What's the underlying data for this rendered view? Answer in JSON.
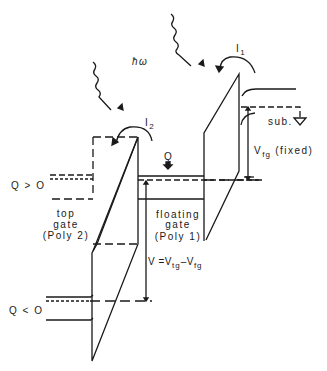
{
  "figure": {
    "photon_label": "ħω",
    "current_1": {
      "symbol": "I",
      "sub": "1"
    },
    "current_2": {
      "symbol": "I",
      "sub": "2"
    },
    "charge_label": "Q",
    "substrate_label": "sub.",
    "vfg": {
      "symbol": "V",
      "sub": "fg",
      "suffix": "(fixed)"
    },
    "q_pos_label": "Q > O",
    "q_neg_label": "Q < O",
    "top_gate": {
      "line1": "top",
      "line2": "gate",
      "line3": "(Poly 2)"
    },
    "floating_gate": {
      "line1": "floating",
      "line2": "gate",
      "line3": "(Poly 1)"
    },
    "voltage": {
      "prefix": "V =",
      "v1": "V",
      "s1": "tg",
      "minus": "–",
      "v2": "V",
      "s2": "fg"
    }
  },
  "colors": {
    "line": "#1a1a1a",
    "background": "#ffffff"
  }
}
